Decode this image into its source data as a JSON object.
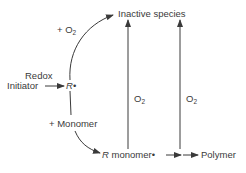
{
  "diagram": {
    "type": "reaction-scheme",
    "nodes": {
      "inactive_species": "Inactive species",
      "initiator": "Initiator",
      "radical": "R•",
      "radical_italic": "R",
      "radical_dot": "•",
      "r_monomer_italic": "R",
      "r_monomer_rest": " monomer•",
      "polymer": "Polymer"
    },
    "labels": {
      "redox": "Redox",
      "plus_o2_prefix": "+ O",
      "plus_o2_sub": "2",
      "plus_monomer": "+ Monomer",
      "o2_left_prefix": "O",
      "o2_left_sub": "2",
      "o2_right_prefix": "O",
      "o2_right_sub": "2"
    },
    "edges": [
      {
        "from": "Initiator",
        "to": "R•",
        "label": "Redox"
      },
      {
        "from": "R•",
        "to": "Inactive species",
        "label": "+ O2"
      },
      {
        "from": "R•",
        "to": "R monomer•",
        "label": "+ Monomer"
      },
      {
        "from": "R monomer•",
        "to": "Inactive species",
        "label": "O2"
      },
      {
        "from": "Polymer chain (intermediate)",
        "to": "Inactive species",
        "label": "O2"
      },
      {
        "from": "R monomer•",
        "to": "Polymer",
        "label": ""
      }
    ],
    "colors": {
      "line": "#3a3a3a",
      "text": "#3a3a3a",
      "background": "#ffffff"
    }
  }
}
